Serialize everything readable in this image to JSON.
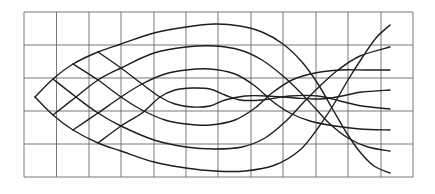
{
  "diagram": {
    "type": "ray-lattice-over-grid",
    "background": "#ffffff",
    "grid": {
      "color": "#6a6a6a",
      "x_lines": [
        24,
        56.5,
        89,
        121,
        154,
        186,
        218,
        251,
        283,
        316,
        348,
        381,
        413
      ],
      "y_lines": [
        12,
        45,
        78,
        111,
        144,
        177
      ],
      "columns": 12,
      "rows": 5
    },
    "curve_color": "#1e1e1e",
    "apex": [
      35,
      97
    ],
    "curves": [
      {
        "name": "upper-arc-1",
        "points": [
          [
            35,
            97
          ],
          [
            53,
            79
          ],
          [
            73,
            64
          ],
          [
            98,
            52
          ],
          [
            121,
            44
          ],
          [
            154,
            33
          ],
          [
            186,
            27
          ],
          [
            215,
            24
          ],
          [
            240,
            26
          ],
          [
            262,
            32
          ],
          [
            283,
            44
          ],
          [
            302,
            62
          ],
          [
            318,
            84
          ],
          [
            332,
            108
          ],
          [
            346,
            132
          ],
          [
            360,
            152
          ],
          [
            374,
            166
          ],
          [
            390,
            173
          ]
        ]
      },
      {
        "name": "upper-arc-2",
        "points": [
          [
            53,
            115
          ],
          [
            76,
            97
          ],
          [
            98,
            80
          ],
          [
            121,
            68
          ],
          [
            154,
            53
          ],
          [
            186,
            47
          ],
          [
            215,
            46
          ],
          [
            240,
            50
          ],
          [
            262,
            60
          ],
          [
            283,
            76
          ],
          [
            300,
            92
          ],
          [
            315,
            108
          ],
          [
            330,
            124
          ],
          [
            348,
            138
          ],
          [
            368,
            147
          ],
          [
            390,
            151
          ]
        ]
      },
      {
        "name": "upper-arc-3",
        "points": [
          [
            73,
            130
          ],
          [
            98,
            113
          ],
          [
            121,
            97
          ],
          [
            142,
            84
          ],
          [
            165,
            74
          ],
          [
            186,
            70
          ],
          [
            210,
            69
          ],
          [
            235,
            74
          ],
          [
            255,
            86
          ],
          [
            272,
            101
          ],
          [
            290,
            113
          ],
          [
            310,
            121
          ],
          [
            335,
            126
          ],
          [
            360,
            129
          ],
          [
            390,
            130
          ]
        ]
      },
      {
        "name": "upper-arc-4",
        "points": [
          [
            98,
            143
          ],
          [
            121,
            126
          ],
          [
            142,
            113
          ],
          [
            160,
            97
          ],
          [
            175,
            90
          ],
          [
            192,
            88
          ],
          [
            210,
            89
          ],
          [
            225,
            95
          ],
          [
            240,
            100
          ],
          [
            262,
            100
          ],
          [
            290,
            96
          ],
          [
            318,
            96
          ],
          [
            340,
            101
          ],
          [
            362,
            106
          ],
          [
            390,
            109
          ]
        ]
      },
      {
        "name": "lower-arc-1",
        "points": [
          [
            35,
            97
          ],
          [
            53,
            115
          ],
          [
            73,
            130
          ],
          [
            98,
            143
          ],
          [
            121,
            151
          ],
          [
            154,
            162
          ],
          [
            186,
            168
          ],
          [
            215,
            171
          ],
          [
            245,
            171
          ],
          [
            275,
            165
          ],
          [
            300,
            150
          ],
          [
            318,
            128
          ],
          [
            334,
            104
          ],
          [
            348,
            80
          ],
          [
            362,
            58
          ],
          [
            376,
            38
          ],
          [
            390,
            25
          ]
        ]
      },
      {
        "name": "lower-arc-2",
        "points": [
          [
            53,
            79
          ],
          [
            76,
            97
          ],
          [
            98,
            113
          ],
          [
            121,
            126
          ],
          [
            154,
            140
          ],
          [
            186,
            147
          ],
          [
            215,
            149
          ],
          [
            242,
            147
          ],
          [
            265,
            138
          ],
          [
            285,
            122
          ],
          [
            303,
            103
          ],
          [
            320,
            86
          ],
          [
            338,
            70
          ],
          [
            360,
            56
          ],
          [
            390,
            47
          ]
        ]
      },
      {
        "name": "lower-arc-3",
        "points": [
          [
            73,
            64
          ],
          [
            98,
            80
          ],
          [
            121,
            97
          ],
          [
            142,
            110
          ],
          [
            165,
            120
          ],
          [
            186,
            124
          ],
          [
            210,
            125
          ],
          [
            235,
            120
          ],
          [
            255,
            108
          ],
          [
            272,
            93
          ],
          [
            292,
            80
          ],
          [
            315,
            73
          ],
          [
            340,
            70
          ],
          [
            365,
            70
          ],
          [
            390,
            70
          ]
        ]
      },
      {
        "name": "lower-arc-4",
        "points": [
          [
            98,
            52
          ],
          [
            121,
            68
          ],
          [
            142,
            84
          ],
          [
            160,
            97
          ],
          [
            175,
            104
          ],
          [
            192,
            107
          ],
          [
            210,
            106
          ],
          [
            225,
            100
          ],
          [
            245,
            96
          ],
          [
            268,
            96
          ],
          [
            295,
            98
          ],
          [
            320,
            99
          ],
          [
            342,
            96
          ],
          [
            362,
            92
          ],
          [
            390,
            90
          ]
        ]
      }
    ]
  }
}
